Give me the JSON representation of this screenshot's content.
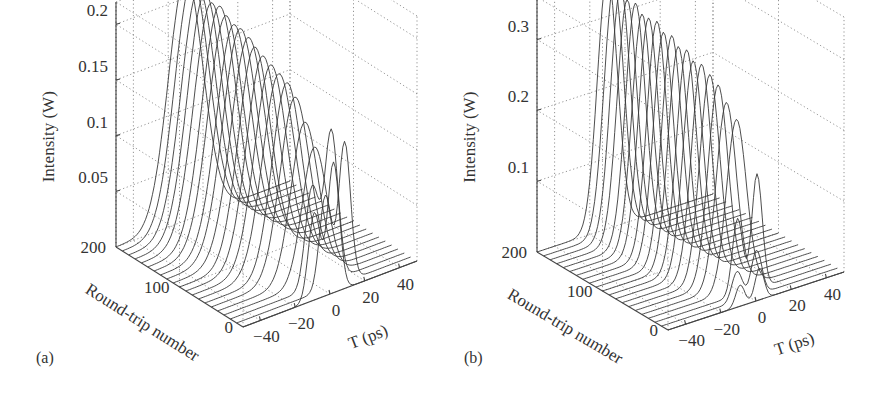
{
  "figure": {
    "panels": [
      {
        "id": "a",
        "label": "(a)"
      },
      {
        "id": "b",
        "label": "(b)"
      }
    ]
  },
  "chart_data": [
    {
      "type": "waterfall-3d",
      "panel_label": "(a)",
      "title": "",
      "zlabel": "Intensity (W)",
      "ylabel": "Round-trip number",
      "xlabel": "T (ps)",
      "z_ticks": [
        "0.05",
        "0.1",
        "0.15",
        "0.2"
      ],
      "z_tick_values": [
        0.05,
        0.1,
        0.15,
        0.2
      ],
      "y_ticks": [
        "0",
        "100",
        "200"
      ],
      "y_tick_values": [
        0,
        100,
        200
      ],
      "x_ticks": [
        "−40",
        "−20",
        "0",
        "20",
        "40"
      ],
      "x_tick_values": [
        -40,
        -20,
        0,
        20,
        40
      ],
      "xlim": [
        -50,
        50
      ],
      "ylim": [
        0,
        200
      ],
      "zlim": [
        0,
        0.22
      ],
      "grid": true,
      "series_count": 21,
      "description": "Initial pulse near T≈-5 ps at round-trip 0 (peak ~0.13 W, slight dip) evolves into a stable pulse centered near T≈-10 ps with peak rising to ~0.22 W at round-trip 200; early traces show double-hump structure around T≈0–10 ps",
      "round_trips": [
        0,
        10,
        20,
        30,
        40,
        50,
        60,
        70,
        80,
        90,
        100,
        110,
        120,
        130,
        140,
        150,
        160,
        170,
        180,
        190,
        200
      ],
      "peak_intensity_W": [
        0.13,
        0.14,
        0.15,
        0.12,
        0.14,
        0.16,
        0.17,
        0.175,
        0.18,
        0.185,
        0.19,
        0.195,
        0.2,
        0.2,
        0.205,
        0.21,
        0.21,
        0.215,
        0.215,
        0.22,
        0.22
      ],
      "pulse_center_ps": [
        -4,
        6,
        2,
        2,
        0,
        -2,
        -3,
        -4,
        -5,
        -6,
        -7,
        -7,
        -8,
        -8,
        -9,
        -9,
        -10,
        -10,
        -10,
        -10,
        -10
      ],
      "pulse_width_ps": [
        8,
        8,
        9,
        10,
        11,
        12,
        12,
        13,
        13,
        13,
        13,
        14,
        14,
        14,
        14,
        14,
        14,
        14,
        14,
        14,
        14
      ]
    },
    {
      "type": "waterfall-3d",
      "panel_label": "(b)",
      "title": "",
      "zlabel": "Intensity (W)",
      "ylabel": "Round-trip number",
      "xlabel": "T (ps)",
      "z_ticks": [
        "0.1",
        "0.2",
        "0.3"
      ],
      "z_tick_values": [
        0.1,
        0.2,
        0.3
      ],
      "y_ticks": [
        "0",
        "100",
        "200"
      ],
      "y_tick_values": [
        0,
        100,
        200
      ],
      "x_ticks": [
        "−40",
        "−20",
        "0",
        "20",
        "40"
      ],
      "x_tick_values": [
        -40,
        -20,
        0,
        20,
        40
      ],
      "xlim": [
        -50,
        50
      ],
      "ylim": [
        0,
        200
      ],
      "zlim": [
        0,
        0.36
      ],
      "grid": true,
      "series_count": 21,
      "description": "Small initial pulse (~0.05 W) near T≈-5 ps at round-trip 0 grows rapidly into a stable pulse of ~0.33–0.36 W centered near T≈-10 ps",
      "round_trips": [
        0,
        10,
        20,
        30,
        40,
        50,
        60,
        70,
        80,
        90,
        100,
        110,
        120,
        130,
        140,
        150,
        160,
        170,
        180,
        190,
        200
      ],
      "peak_intensity_W": [
        0.05,
        0.07,
        0.18,
        0.24,
        0.26,
        0.28,
        0.29,
        0.3,
        0.3,
        0.31,
        0.31,
        0.32,
        0.32,
        0.33,
        0.33,
        0.33,
        0.34,
        0.34,
        0.35,
        0.35,
        0.36
      ],
      "pulse_center_ps": [
        -4,
        -2,
        2,
        0,
        -2,
        -3,
        -4,
        -5,
        -6,
        -6,
        -7,
        -7,
        -8,
        -8,
        -9,
        -9,
        -9,
        -10,
        -10,
        -10,
        -10
      ],
      "pulse_width_ps": [
        6,
        7,
        7,
        8,
        8,
        8,
        8,
        8,
        8,
        8,
        8,
        8,
        8,
        8,
        8,
        8,
        8,
        8,
        8,
        8,
        8
      ]
    }
  ]
}
